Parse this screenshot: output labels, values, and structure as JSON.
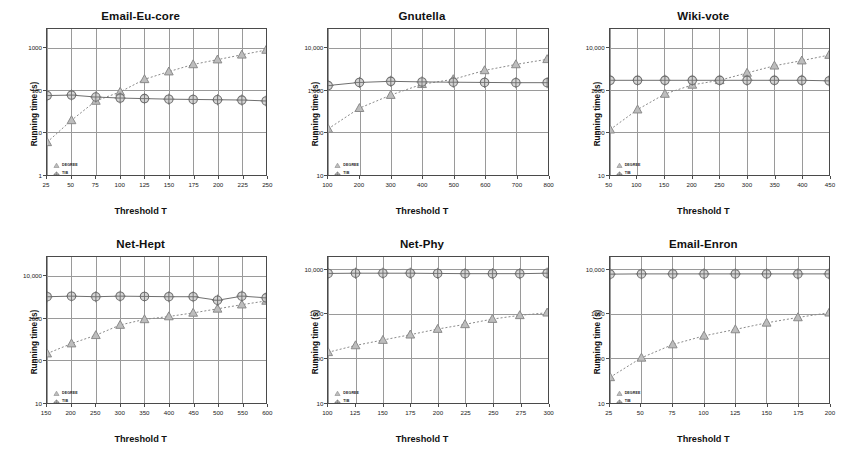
{
  "figure": {
    "axis_x_title": "Threshold T",
    "axis_y_title": "Running time (s)",
    "legend": {
      "degree_label": "DEGREE",
      "tib_label": "TIB"
    },
    "colors": {
      "degree": "#8a8a8a",
      "tib": "#6f6f6f",
      "axis": "#4a4a4a",
      "grid": "#9a9a9a",
      "text": "#1a1a1a"
    }
  },
  "chart_data": [
    {
      "type": "line",
      "title": "Email-Eu-core",
      "xlabel": "Threshold T",
      "ylabel": "Running time (s)",
      "yscale": "log",
      "ylim": [
        1,
        3000
      ],
      "yticks": [
        1,
        10,
        100,
        1000
      ],
      "ytick_labels": [
        "1",
        "10",
        "100",
        "1000"
      ],
      "categories": [
        25,
        50,
        75,
        100,
        125,
        150,
        175,
        200,
        225,
        250
      ],
      "xtick_labels": [
        "25",
        "50",
        "75",
        "100",
        "125",
        "150",
        "175",
        "200",
        "225",
        "250"
      ],
      "grid": true,
      "legend_position": "bottom-left",
      "series": [
        {
          "name": "DEGREE",
          "values": [
            6,
            20,
            58,
            95,
            190,
            290,
            430,
            560,
            730,
            950
          ]
        },
        {
          "name": "TIB",
          "values": [
            78,
            80,
            72,
            68,
            66,
            64,
            63,
            62,
            61,
            58
          ]
        }
      ]
    },
    {
      "type": "line",
      "title": "Gnutella",
      "xlabel": "Threshold T",
      "ylabel": "Running time (s)",
      "yscale": "log",
      "ylim": [
        10,
        30000
      ],
      "yticks": [
        10,
        100,
        1000,
        10000
      ],
      "ytick_labels": [
        "10",
        "100",
        "1,000",
        "10,000"
      ],
      "categories": [
        100,
        200,
        300,
        400,
        500,
        600,
        700,
        800
      ],
      "xtick_labels": [
        "100",
        "200",
        "300",
        "400",
        "500",
        "600",
        "700",
        "800"
      ],
      "grid": true,
      "legend_position": "bottom-left",
      "series": [
        {
          "name": "DEGREE",
          "values": [
            125,
            390,
            800,
            1450,
            1900,
            3100,
            4300,
            5700
          ]
        },
        {
          "name": "TIB",
          "values": [
            1350,
            1600,
            1700,
            1650,
            1620,
            1600,
            1580,
            1580
          ]
        }
      ]
    },
    {
      "type": "line",
      "title": "Wiki-vote",
      "xlabel": "Threshold T",
      "ylabel": "Running time (s)",
      "yscale": "log",
      "ylim": [
        10,
        30000
      ],
      "yticks": [
        10,
        100,
        1000,
        10000
      ],
      "ytick_labels": [
        "10",
        "100",
        "1000",
        "10,000"
      ],
      "categories": [
        50,
        100,
        150,
        200,
        250,
        300,
        350,
        400,
        450
      ],
      "xtick_labels": [
        "50",
        "100",
        "150",
        "200",
        "250",
        "300",
        "350",
        "400",
        "450"
      ],
      "grid": true,
      "legend_position": "bottom-left",
      "series": [
        {
          "name": "DEGREE",
          "values": [
            120,
            360,
            850,
            1400,
            1800,
            2700,
            4000,
            5300,
            7200
          ]
        },
        {
          "name": "TIB",
          "values": [
            1800,
            1800,
            1800,
            1800,
            1800,
            1800,
            1800,
            1800,
            1750
          ]
        }
      ]
    },
    {
      "type": "line",
      "title": "Net-Hept",
      "xlabel": "Threshold T",
      "ylabel": "Running time (s)",
      "yscale": "log",
      "ylim": [
        10,
        30000
      ],
      "yticks": [
        10,
        100,
        1000,
        10000
      ],
      "ytick_labels": [
        "10",
        "100",
        "1000",
        "10,000"
      ],
      "categories": [
        150,
        200,
        250,
        300,
        350,
        400,
        450,
        500,
        550,
        600
      ],
      "xtick_labels": [
        "150",
        "200",
        "250",
        "300",
        "350",
        "400",
        "450",
        "500",
        "550",
        "600"
      ],
      "grid": true,
      "legend_position": "bottom-left",
      "series": [
        {
          "name": "DEGREE",
          "values": [
            150,
            260,
            410,
            720,
            980,
            1150,
            1400,
            1750,
            2200,
            2700
          ]
        },
        {
          "name": "TIB",
          "values": [
            3400,
            3500,
            3400,
            3500,
            3450,
            3400,
            3400,
            2800,
            3500,
            3200
          ]
        }
      ]
    },
    {
      "type": "line",
      "title": "Net-Phy",
      "xlabel": "Threshold T",
      "ylabel": "Running time (s)",
      "yscale": "log",
      "ylim": [
        10,
        20000
      ],
      "yticks": [
        10,
        100,
        1000,
        10000
      ],
      "ytick_labels": [
        "10",
        "100",
        "1000",
        "10,000"
      ],
      "categories": [
        100,
        125,
        150,
        175,
        200,
        225,
        250,
        275,
        300
      ],
      "xtick_labels": [
        "100",
        "125",
        "150",
        "175",
        "200",
        "225",
        "250",
        "275",
        "300"
      ],
      "grid": true,
      "legend_position": "bottom-left",
      "series": [
        {
          "name": "DEGREE",
          "values": [
            140,
            200,
            265,
            350,
            470,
            600,
            790,
            960,
            1100
          ]
        },
        {
          "name": "TIB",
          "values": [
            8500,
            8600,
            8600,
            8600,
            8500,
            8400,
            8400,
            8400,
            8600
          ]
        }
      ]
    },
    {
      "type": "line",
      "title": "Email-Enron",
      "xlabel": "Threshold T",
      "ylabel": "Running time (s)",
      "yscale": "log",
      "ylim": [
        10,
        20000
      ],
      "yticks": [
        10,
        100,
        1000,
        10000
      ],
      "ytick_labels": [
        "10",
        "100",
        "1000",
        "10,000"
      ],
      "categories": [
        25,
        50,
        75,
        100,
        125,
        150,
        175,
        200
      ],
      "xtick_labels": [
        "25",
        "50",
        "75",
        "100",
        "125",
        "150",
        "175",
        "200"
      ],
      "grid": true,
      "legend_position": "bottom-left",
      "series": [
        {
          "name": "DEGREE",
          "values": [
            38,
            105,
            210,
            330,
            460,
            650,
            860,
            1100
          ]
        },
        {
          "name": "TIB",
          "values": [
            8200,
            8300,
            8300,
            8300,
            8300,
            8300,
            8300,
            8300
          ]
        }
      ]
    }
  ]
}
